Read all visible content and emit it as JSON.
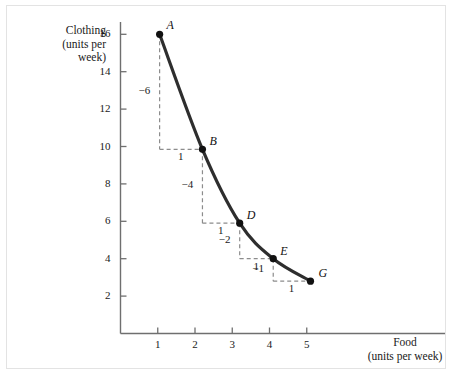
{
  "chart_data": {
    "type": "line",
    "title": "",
    "xlabel": "Food",
    "xlabel_sub": "(units per week)",
    "ylabel": "Clothing",
    "ylabel_sub_1": "(units per",
    "ylabel_sub_2": "week)",
    "xlim": [
      0,
      6
    ],
    "ylim": [
      0,
      17.2
    ],
    "xticks": [
      1,
      2,
      3,
      4,
      5
    ],
    "yticks": [
      2,
      4,
      6,
      8,
      10,
      12,
      14,
      16
    ],
    "xtick_labels": [
      "1",
      "2",
      "3",
      "4",
      "5"
    ],
    "ytick_labels": [
      "2",
      "4",
      "6",
      "8",
      "10",
      "12",
      "14",
      "16"
    ],
    "grid": false,
    "legend": false,
    "curve_color": "#2e2e2e",
    "annotation_color": "#8c8c8c",
    "series": [
      {
        "name": "indifference-curve",
        "points": [
          {
            "label": "A",
            "x": 1.05,
            "y": 16.0
          },
          {
            "label": "B",
            "x": 2.2,
            "y": 9.85
          },
          {
            "label": "D",
            "x": 3.2,
            "y": 5.9
          },
          {
            "label": "E",
            "x": 4.1,
            "y": 4.0
          },
          {
            "label": "G",
            "x": 5.1,
            "y": 2.8
          }
        ]
      }
    ],
    "steps": [
      {
        "from": "A",
        "to": "B",
        "dy_label": "−6",
        "dx_label": "1",
        "x0": 1.05,
        "y0": 16.0,
        "x1": 2.2,
        "y1": 9.85
      },
      {
        "from": "B",
        "to": "D",
        "dy_label": "−4",
        "dx_label": "1",
        "x0": 2.2,
        "y0": 9.85,
        "x1": 3.2,
        "y1": 5.9
      },
      {
        "from": "D",
        "to": "E",
        "dy_label": "−2",
        "dx_label": "1",
        "x0": 3.2,
        "y0": 5.9,
        "x1": 4.1,
        "y1": 4.0
      },
      {
        "from": "E",
        "to": "G",
        "dy_label": "−1",
        "dx_label": "1",
        "x0": 4.1,
        "y0": 4.0,
        "x1": 5.1,
        "y1": 2.8
      }
    ]
  }
}
